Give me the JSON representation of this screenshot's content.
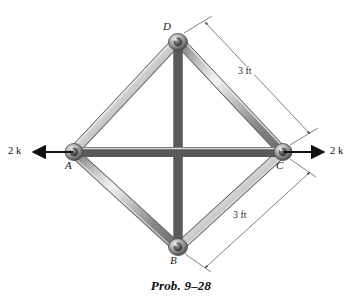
{
  "figure": {
    "caption": "Prob. 9–28",
    "background_color": "#ffffff",
    "member_color_light": "#e8e8e8",
    "member_color_mid": "#9a9a9a",
    "member_color_dark": "#5e5e5e",
    "joint_color": "#8c8c8c",
    "line_color": "#333333"
  },
  "joints": [
    {
      "id": "D",
      "label": "D",
      "x": 178,
      "y": 40,
      "label_x": 163,
      "label_y": 22
    },
    {
      "id": "A",
      "label": "A",
      "x": 73,
      "y": 152,
      "label_x": 66,
      "label_y": 161
    },
    {
      "id": "C",
      "label": "C",
      "x": 283,
      "y": 152,
      "label_x": 277,
      "label_y": 161
    },
    {
      "id": "B",
      "label": "B",
      "x": 178,
      "y": 248,
      "label_x": 171,
      "label_y": 256
    }
  ],
  "members": [
    {
      "from": "A",
      "to": "D"
    },
    {
      "from": "D",
      "to": "C"
    },
    {
      "from": "C",
      "to": "B"
    },
    {
      "from": "B",
      "to": "A"
    },
    {
      "from": "D",
      "to": "B"
    },
    {
      "from": "A",
      "to": "C"
    }
  ],
  "loads": [
    {
      "id": "load-left",
      "label": "2 k",
      "magnitude": 2,
      "unit": "k",
      "direction": "left",
      "at_joint": "A",
      "tail_x": 73,
      "tail_y": 152,
      "tip_x": 30,
      "tip_y": 152,
      "label_x": 8,
      "label_y": 147
    },
    {
      "id": "load-right",
      "label": "2 k",
      "magnitude": 2,
      "unit": "k",
      "direction": "right",
      "at_joint": "C",
      "tail_x": 283,
      "tail_y": 152,
      "tip_x": 327,
      "tip_y": 152,
      "label_x": 331,
      "label_y": 147
    }
  ],
  "dimensions": [
    {
      "id": "dim-dc",
      "label": "3 ft",
      "value": 3,
      "unit": "ft",
      "spans": "D-C",
      "label_x": 239,
      "label_y": 72
    },
    {
      "id": "dim-bc",
      "label": "3 ft",
      "value": 3,
      "unit": "ft",
      "spans": "B-C",
      "label_x": 234,
      "label_y": 216
    }
  ]
}
